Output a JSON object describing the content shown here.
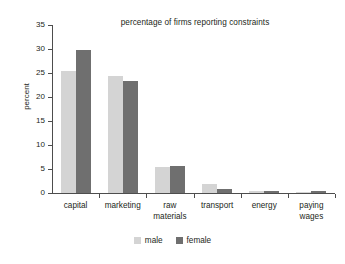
{
  "chart_data": {
    "type": "bar",
    "title": "percentage of firms reporting constraints",
    "xlabel": "",
    "ylabel": "percent",
    "categories": [
      "capital",
      "marketing",
      "raw\nmaterials",
      "transport",
      "energy",
      "paying\nwages"
    ],
    "series": [
      {
        "name": "male",
        "color": "#d4d4d4",
        "values": [
          25.4,
          24.4,
          5.4,
          1.8,
          0.4,
          0.3
        ]
      },
      {
        "name": "female",
        "color": "#6f6f6f",
        "values": [
          29.7,
          23.4,
          5.7,
          0.9,
          0.4,
          0.4
        ]
      }
    ],
    "ylim": [
      0,
      35
    ],
    "yticks": [
      0,
      5,
      10,
      15,
      20,
      25,
      30,
      35
    ],
    "grid": false,
    "legend_position": "bottom"
  }
}
